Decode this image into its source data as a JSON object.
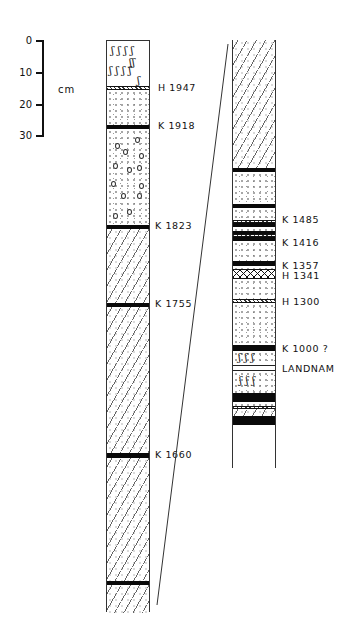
{
  "scale": {
    "unit": "cm",
    "ticks": [
      {
        "label": "0",
        "y": 40
      },
      {
        "label": "10",
        "y": 72
      },
      {
        "label": "20",
        "y": 104
      },
      {
        "label": "30",
        "y": 136
      }
    ]
  },
  "left_profile": {
    "markers": [
      {
        "label": "H 1947",
        "y": 88
      },
      {
        "label": "K 1918",
        "y": 126
      },
      {
        "label": "K 1823",
        "y": 226
      },
      {
        "label": "K 1755",
        "y": 304
      },
      {
        "label": "K 1660",
        "y": 455
      }
    ]
  },
  "right_profile": {
    "markers": [
      {
        "label": "K 1485",
        "y": 220
      },
      {
        "label": "K 1416",
        "y": 243
      },
      {
        "label": "K 1357",
        "y": 265
      },
      {
        "label": "H 1341",
        "y": 276
      },
      {
        "label": "H 1300",
        "y": 302
      },
      {
        "label": "K 1000 ?",
        "y": 348
      },
      {
        "label": "LANDNAM",
        "y": 368
      }
    ]
  },
  "layer_types": {
    "H": "Hekla tephra",
    "K": "Katla tephra",
    "landnam": "Settlement layer"
  }
}
